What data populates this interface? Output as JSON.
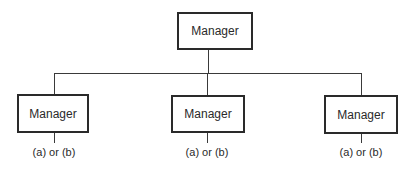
{
  "diagram": {
    "type": "org-chart",
    "root": {
      "label": "Manager"
    },
    "children": [
      {
        "label": "Manager",
        "note": "(a) or (b)"
      },
      {
        "label": "Manager",
        "note": "(a) or (b)"
      },
      {
        "label": "Manager",
        "note": "(a) or (b)"
      }
    ]
  }
}
